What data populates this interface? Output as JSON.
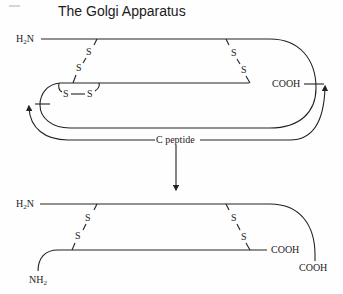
{
  "title": "The Golgi Apparatus",
  "proinsulin": {
    "n_terminus": "H",
    "n_terminus_sub": "2",
    "n_terminus_tail": "N",
    "c_terminus": "COOH",
    "disulfide_left": [
      "S",
      "S"
    ],
    "disulfide_right": [
      "S",
      "S"
    ],
    "intrachain": [
      "S",
      "S"
    ],
    "connector_label": "C peptide"
  },
  "insulin": {
    "b_chain_n": "H",
    "b_chain_n_sub": "2",
    "b_chain_n_tail": "N",
    "a_chain_c": "COOH",
    "b_chain_c": "COOH",
    "a_chain_n": "NH",
    "a_chain_n_sub": "2",
    "disulfide_left": [
      "S",
      "S"
    ],
    "disulfide_right": [
      "S",
      "S"
    ]
  },
  "colors": {
    "line": "#222222",
    "background": "#fefefe"
  }
}
